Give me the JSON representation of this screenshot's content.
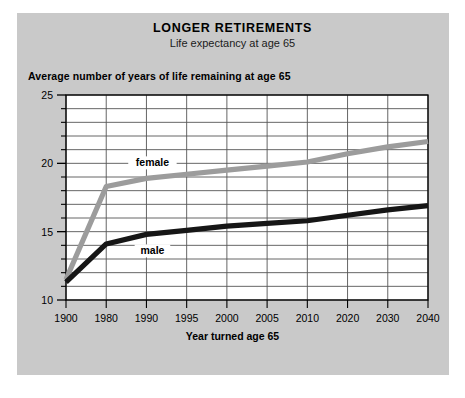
{
  "title": "LONGER RETIREMENTS",
  "subtitle": "Life expectancy at age 65",
  "source": "Source: U.S. Social Security Administration",
  "colors": {
    "panel": "#c9c9c9",
    "plot_background": "#ffffff",
    "grid": "#555555",
    "axis": "#000000",
    "female_line": "#9c9c9c",
    "male_line": "#161616",
    "text": "#000000"
  },
  "chart_data": {
    "type": "line",
    "title": "LONGER RETIREMENTS",
    "subtitle": "Life expectancy at age 65",
    "xlabel": "Year turned age 65",
    "ylabel": "Average number of years of life remaining at age 65",
    "categories": [
      "1900",
      "1980",
      "1990",
      "1995",
      "2000",
      "2005",
      "2010",
      "2020",
      "2030",
      "2040"
    ],
    "ylim": [
      10,
      25
    ],
    "yticks": [
      10,
      15,
      20,
      25
    ],
    "ytick_labels": [
      "10",
      "15",
      "20",
      "25"
    ],
    "yminorticks": [
      11,
      12,
      13,
      14,
      16,
      17,
      18,
      19,
      21,
      22,
      23,
      24
    ],
    "grid": true,
    "legend_position": "inline-annotations",
    "series": [
      {
        "name": "female",
        "color": "#9c9c9c",
        "label": "female",
        "values": [
          11.5,
          18.3,
          18.9,
          19.2,
          19.5,
          19.8,
          20.1,
          20.7,
          21.2,
          21.6
        ]
      },
      {
        "name": "male",
        "color": "#161616",
        "label": "male",
        "values": [
          11.3,
          14.1,
          14.8,
          15.1,
          15.4,
          15.6,
          15.8,
          16.2,
          16.6,
          16.9
        ]
      }
    ]
  }
}
